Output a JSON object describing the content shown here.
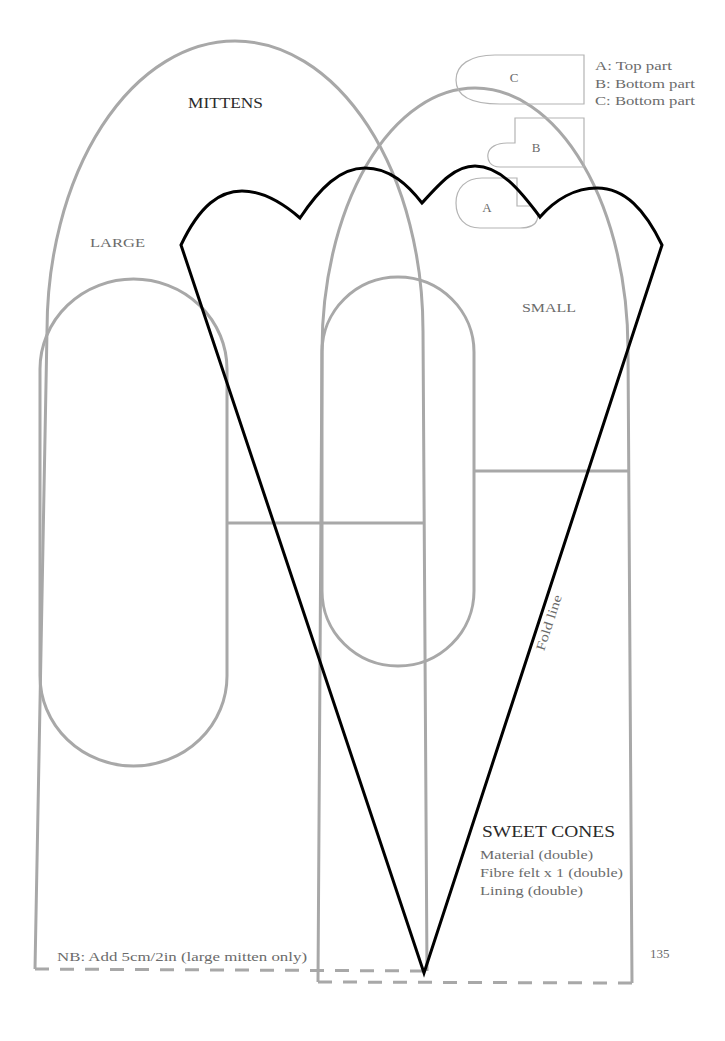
{
  "page": {
    "number": "135"
  },
  "legend": {
    "items": [
      "A: Top part",
      "B: Bottom part",
      "C: Bottom part"
    ]
  },
  "pieces": {
    "a": "A",
    "b": "B",
    "c": "C"
  },
  "mittens": {
    "title": "MITTENS",
    "large_label": "LARGE",
    "small_label": "SMALL",
    "note": "NB: Add 5cm/2in (large mitten only)"
  },
  "cone": {
    "title": "SWEET CONES",
    "fold_label": "Fold line",
    "materials": [
      "Material (double)",
      "Fibre felt x 1 (double)",
      "Lining (double)"
    ]
  },
  "colors": {
    "pattern_line": "#a8a8a8",
    "piece_line": "#b4b4b4",
    "cone_line": "#000000",
    "label_text": "#6b6b6b",
    "heading_text": "#2a2a2a",
    "background": "#ffffff"
  }
}
